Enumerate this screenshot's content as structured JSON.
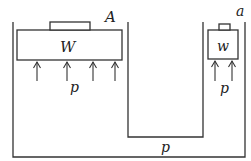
{
  "diagram": {
    "type": "hydraulic-press",
    "labels": {
      "large_piston_area": "A",
      "large_piston_weight": "W",
      "small_piston_area": "a",
      "small_piston_weight": "w",
      "pressure_left": "p",
      "pressure_right": "p",
      "pressure_bottom": "p"
    },
    "arrows": {
      "left_count": 4,
      "right_count": 2
    },
    "colors": {
      "stroke": "#333333",
      "background": "#ffffff"
    }
  }
}
